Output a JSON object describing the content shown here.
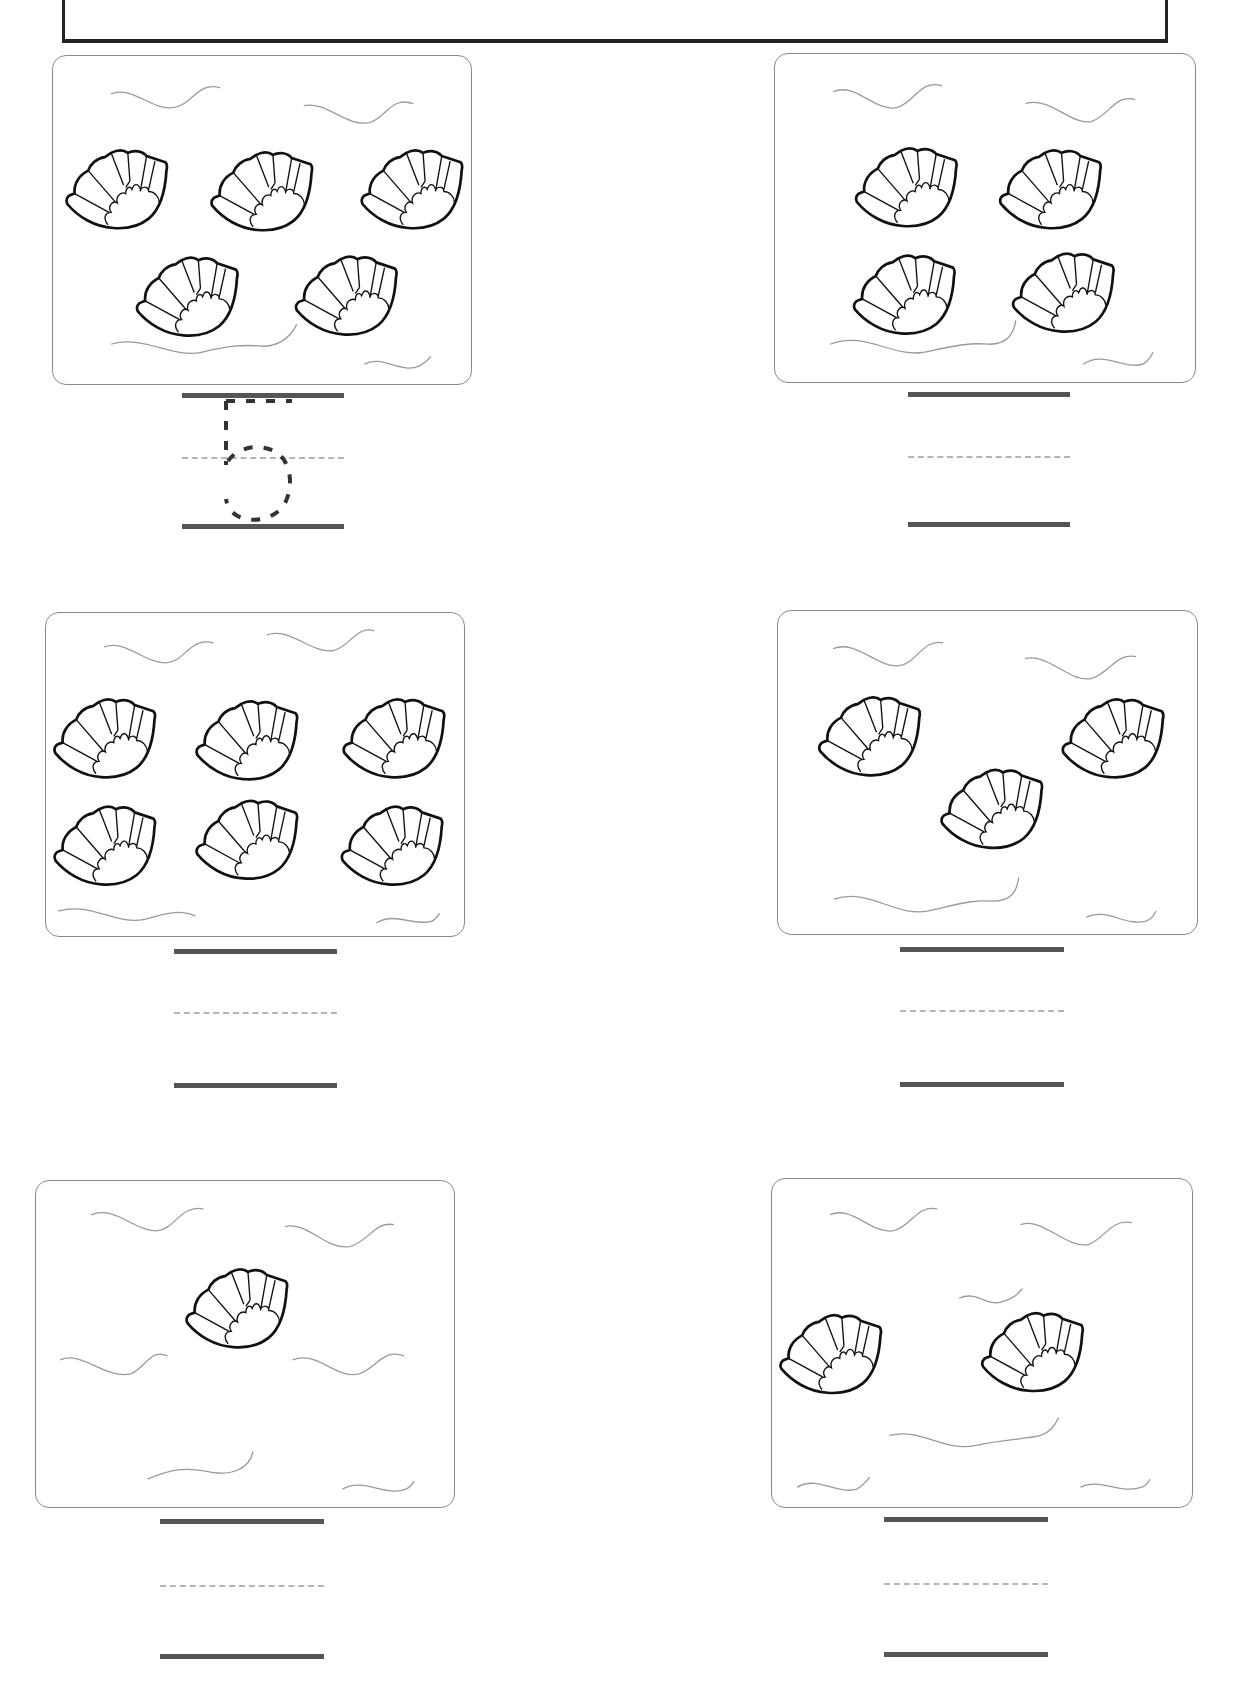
{
  "worksheet": {
    "title": "",
    "panels": [
      {
        "id": 1,
        "shell_count": 5,
        "answer_trace": "5",
        "answer_value": ""
      },
      {
        "id": 2,
        "shell_count": 4,
        "answer_trace": "",
        "answer_value": ""
      },
      {
        "id": 3,
        "shell_count": 6,
        "answer_trace": "",
        "answer_value": ""
      },
      {
        "id": 4,
        "shell_count": 3,
        "answer_trace": "",
        "answer_value": ""
      },
      {
        "id": 5,
        "shell_count": 1,
        "answer_trace": "",
        "answer_value": ""
      },
      {
        "id": 6,
        "shell_count": 2,
        "answer_trace": "",
        "answer_value": ""
      }
    ]
  },
  "icons": {
    "shell": "scallop-shell-icon",
    "wave": "wave-line-icon"
  },
  "colors": {
    "outline": "#111111",
    "panel_border": "#8a8a8a",
    "writing_line": "#555555",
    "guide_dash": "#b5b5b5",
    "wave": "#9a9a9a"
  }
}
